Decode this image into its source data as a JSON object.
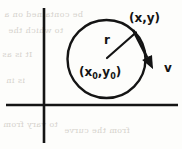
{
  "figure": {
    "background_color": "#fdfdfb",
    "ink_color": "#141414",
    "ghost_color": "#c9c5bd",
    "width": 182,
    "height": 149,
    "axes": {
      "name": "cartesian-axes",
      "vertical_x": 44,
      "vertical_y1": 8,
      "vertical_y2": 143,
      "horizontal_y": 105,
      "horizontal_x1": 6,
      "horizontal_x2": 178,
      "stroke_width": 2.6
    },
    "circle": {
      "name": "trajectory-circle",
      "cx": 106.5,
      "cy": 59,
      "r": 39,
      "stroke_width": 2.4
    },
    "radius_vector": {
      "name": "radius-line",
      "x1": 107,
      "y1": 58,
      "x2": 136,
      "y2": 32.5,
      "stroke_width": 2.2
    },
    "velocity_vector": {
      "name": "velocity-arrow",
      "x1": 133,
      "y1": 30,
      "x2": 153,
      "y2": 69,
      "stroke_width": 2.6,
      "head_length": 13,
      "head_width": 11
    },
    "labels": {
      "point_on_circle": "(x,y)",
      "center": "(x",
      "center_sub1": "0",
      "center_mid": ",y",
      "center_sub2": "0",
      "center_end": ")",
      "center_full": "(x₀,y₀)",
      "radius": "r",
      "velocity": "v"
    },
    "ghost_text": [
      "be contained on a",
      "to which the",
      "It is as",
      "is in",
      "to vary from",
      "from  the  curve"
    ]
  }
}
